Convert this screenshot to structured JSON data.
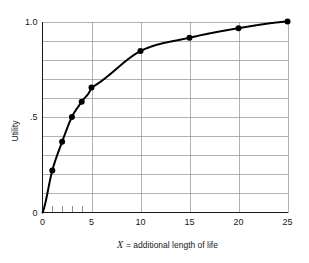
{
  "chart_data": {
    "type": "line",
    "title": "",
    "subtitle": "",
    "xlabel_italic": "X",
    "xlabel_rest": "= additional length of life",
    "xlabel": "X = additional length of life",
    "ylabel": "Utility",
    "xlim": [
      0,
      25
    ],
    "ylim": [
      0,
      1.0
    ],
    "grid": true,
    "legend": "none",
    "x_ticks": [
      0,
      5,
      10,
      15,
      20,
      25
    ],
    "x_tick_labels": [
      "0",
      "5",
      "10",
      "15",
      "20",
      "25"
    ],
    "x_minor_ticks": [
      1,
      2,
      3,
      4
    ],
    "y_ticks": [
      0,
      0.5,
      1.0
    ],
    "y_tick_labels": [
      "0",
      ".5",
      "1.0"
    ],
    "y_gridlines": [
      0.1,
      0.2,
      0.3,
      0.4,
      0.5,
      0.6,
      0.7,
      0.8,
      0.9,
      1.0
    ],
    "x_gridlines": [
      5,
      10,
      15,
      20,
      25
    ],
    "series": [
      {
        "name": "Utility of additional length of life",
        "marker": "filled-circle",
        "color": "#000000",
        "x": [
          0,
          1,
          2,
          3,
          4,
          5,
          10,
          15,
          20,
          25
        ],
        "y": [
          0.0,
          0.22,
          0.37,
          0.5,
          0.58,
          0.655,
          0.845,
          0.915,
          0.965,
          1.0
        ],
        "marker_x": [
          1,
          2,
          3,
          4,
          5,
          10,
          15,
          20,
          25
        ],
        "marker_y": [
          0.22,
          0.37,
          0.5,
          0.58,
          0.655,
          0.845,
          0.915,
          0.965,
          1.0
        ]
      }
    ],
    "colors": {
      "curve": "#000000",
      "grid": "#8d9298",
      "axis": "#15181c",
      "background": "#ffffff"
    }
  }
}
